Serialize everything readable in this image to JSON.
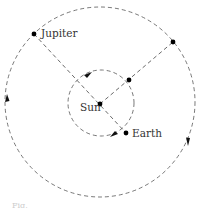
{
  "diagram": {
    "type": "orbital-diagram",
    "bodies": [
      {
        "id": "sun",
        "label": "Sun",
        "x": 100,
        "y": 104
      },
      {
        "id": "earth",
        "label": "Earth",
        "x": 126,
        "y": 133
      },
      {
        "id": "jupiter",
        "label": "Jupiter",
        "x": 34,
        "y": 34
      }
    ],
    "orbits": [
      {
        "id": "earth-orbit",
        "cx": 101,
        "cy": 103,
        "r": 33,
        "style": "dashed"
      },
      {
        "id": "jupiter-orbit",
        "cx": 100,
        "cy": 102,
        "r": 95,
        "style": "dashed"
      }
    ],
    "points": [
      {
        "id": "earth-later",
        "x": 129,
        "y": 80
      },
      {
        "id": "jupiter-later",
        "x": 173,
        "y": 42
      }
    ],
    "lines": [
      {
        "id": "line-jupiter-earth",
        "from": "jupiter",
        "to": "earth",
        "style": "dashed"
      },
      {
        "id": "line-sun-later",
        "from": "sun",
        "to": "jupiter-later",
        "style": "dashed"
      }
    ],
    "direction": "counterclockwise",
    "caption_fragment": "Fig."
  }
}
